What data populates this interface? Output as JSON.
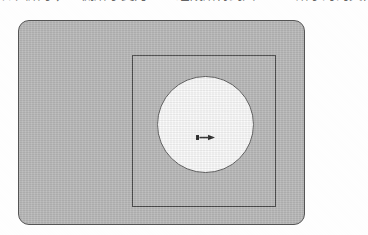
{
  "caption": {
    "text": "如图所示，一侧所示变为 CD 组成所得到图 4-66 所示的的文件。"
  },
  "figure": {
    "title": "",
    "outer_shape": {
      "name": "rounded-rectangle",
      "fill_color": "#b9b9b9",
      "stroke_color": "#555555",
      "corner_radius": 11
    },
    "inner_shape": {
      "name": "square-outline",
      "fill_color": "transparent",
      "stroke_color": "#4a4a4a"
    },
    "circle": {
      "name": "circle",
      "fill_color": "#fbfbfb",
      "stroke_color": "#606060",
      "diameter": 97
    },
    "center_marker": {
      "name": "double-arrow-marker",
      "color": "#2b2b2b"
    }
  }
}
